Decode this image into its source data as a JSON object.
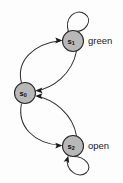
{
  "diagram": {
    "type": "state-machine",
    "title": "",
    "background_color": "#fdfdfd",
    "node_fill": "#b8b8b8",
    "node_stroke": "#2a2a2a",
    "edge_color": "#333333",
    "nodes": [
      {
        "id": "s0",
        "base": "s",
        "subscript": "0",
        "label": "",
        "cx": 25,
        "cy": 93,
        "r": 10.5
      },
      {
        "id": "s1",
        "base": "s",
        "subscript": "1",
        "label": "green",
        "cx": 73,
        "cy": 41,
        "r": 10.5
      },
      {
        "id": "s2",
        "base": "s",
        "subscript": "2",
        "label": "open",
        "cx": 73,
        "cy": 146,
        "r": 10.5
      }
    ],
    "edges": [
      {
        "from": "s0",
        "to": "s1",
        "kind": "curve",
        "bow": "left"
      },
      {
        "from": "s1",
        "to": "s0",
        "kind": "curve",
        "bow": "right"
      },
      {
        "from": "s0",
        "to": "s2",
        "kind": "curve",
        "bow": "left"
      },
      {
        "from": "s2",
        "to": "s0",
        "kind": "curve",
        "bow": "right"
      },
      {
        "from": "s1",
        "to": "s1",
        "kind": "self-loop",
        "side": "top"
      },
      {
        "from": "s2",
        "to": "s2",
        "kind": "self-loop",
        "side": "bottom"
      }
    ],
    "labels": [
      {
        "for": "s1",
        "text": "green",
        "x": 88,
        "y": 41
      },
      {
        "for": "s2",
        "text": "open",
        "x": 88,
        "y": 146
      }
    ]
  }
}
